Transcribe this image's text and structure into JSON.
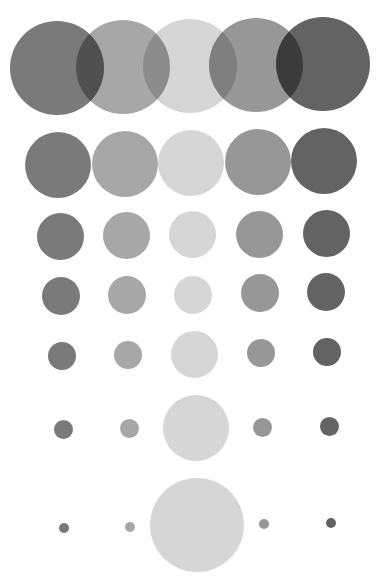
{
  "palette": {
    "c1": "#7a7a7a",
    "c2": "#a7a7a7",
    "c3": "#d6d6d6",
    "c4": "#979797",
    "c5": "#636363",
    "background": "#ffffff"
  },
  "rows": [
    {
      "name": "row-1",
      "circles": [
        {
          "cx": 57,
          "cy": 68,
          "d": 94,
          "color": "c1"
        },
        {
          "cx": 123,
          "cy": 67,
          "d": 94,
          "color": "c2"
        },
        {
          "cx": 190,
          "cy": 66,
          "d": 94,
          "color": "c3"
        },
        {
          "cx": 256,
          "cy": 65,
          "d": 94,
          "color": "c4"
        },
        {
          "cx": 323,
          "cy": 64,
          "d": 94,
          "color": "c5"
        }
      ]
    },
    {
      "name": "row-2",
      "circles": [
        {
          "cx": 58,
          "cy": 165,
          "d": 66,
          "color": "c1"
        },
        {
          "cx": 125,
          "cy": 164,
          "d": 66,
          "color": "c2"
        },
        {
          "cx": 191,
          "cy": 163,
          "d": 66,
          "color": "c3"
        },
        {
          "cx": 258,
          "cy": 162,
          "d": 66,
          "color": "c4"
        },
        {
          "cx": 324,
          "cy": 161,
          "d": 66,
          "color": "c5"
        }
      ]
    },
    {
      "name": "row-3",
      "circles": [
        {
          "cx": 60,
          "cy": 236,
          "d": 47,
          "color": "c1"
        },
        {
          "cx": 126,
          "cy": 235,
          "d": 47,
          "color": "c2"
        },
        {
          "cx": 192,
          "cy": 234,
          "d": 47,
          "color": "c3"
        },
        {
          "cx": 259,
          "cy": 234,
          "d": 47,
          "color": "c4"
        },
        {
          "cx": 326,
          "cy": 233,
          "d": 47,
          "color": "c5"
        }
      ]
    },
    {
      "name": "row-4",
      "circles": [
        {
          "cx": 61,
          "cy": 296,
          "d": 38,
          "color": "c1"
        },
        {
          "cx": 127,
          "cy": 295,
          "d": 38,
          "color": "c2"
        },
        {
          "cx": 193,
          "cy": 295,
          "d": 38,
          "color": "c3"
        },
        {
          "cx": 260,
          "cy": 293,
          "d": 38,
          "color": "c4"
        },
        {
          "cx": 326,
          "cy": 292,
          "d": 38,
          "color": "c5"
        }
      ]
    },
    {
      "name": "row-5",
      "circles": [
        {
          "cx": 62,
          "cy": 356,
          "d": 28,
          "color": "c1"
        },
        {
          "cx": 128,
          "cy": 355,
          "d": 28,
          "color": "c2"
        },
        {
          "cx": 194,
          "cy": 354,
          "d": 47,
          "color": "c3"
        },
        {
          "cx": 261,
          "cy": 353,
          "d": 28,
          "color": "c4"
        },
        {
          "cx": 327,
          "cy": 352,
          "d": 28,
          "color": "c5"
        }
      ]
    },
    {
      "name": "row-6",
      "circles": [
        {
          "cx": 63,
          "cy": 429,
          "d": 19,
          "color": "c1"
        },
        {
          "cx": 129,
          "cy": 428,
          "d": 19,
          "color": "c2"
        },
        {
          "cx": 196,
          "cy": 428,
          "d": 66,
          "color": "c3"
        },
        {
          "cx": 262,
          "cy": 427,
          "d": 19,
          "color": "c4"
        },
        {
          "cx": 329,
          "cy": 426,
          "d": 19,
          "color": "c5"
        }
      ]
    },
    {
      "name": "row-7",
      "circles": [
        {
          "cx": 64,
          "cy": 528,
          "d": 10,
          "color": "c1"
        },
        {
          "cx": 130,
          "cy": 527,
          "d": 10,
          "color": "c2"
        },
        {
          "cx": 197,
          "cy": 525,
          "d": 94,
          "color": "c3"
        },
        {
          "cx": 264,
          "cy": 524,
          "d": 10,
          "color": "c4"
        },
        {
          "cx": 331,
          "cy": 523,
          "d": 10,
          "color": "c5"
        }
      ]
    }
  ]
}
